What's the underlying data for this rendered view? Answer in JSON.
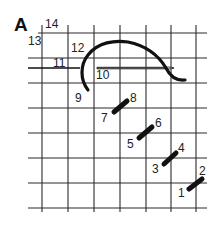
{
  "figure": {
    "panel_label": "A",
    "grid": {
      "vertical_x": [
        42,
        68,
        94,
        120,
        146,
        171,
        196
      ],
      "horizontal_y": [
        33,
        58,
        83,
        108,
        133,
        158,
        183,
        208
      ],
      "x_extent": [
        28,
        207
      ],
      "y_extent": [
        25,
        212
      ],
      "line_color": "#2a2a2a"
    },
    "point_labels": [
      {
        "id": "1",
        "text": "1",
        "x": 178,
        "y": 197
      },
      {
        "id": "2",
        "text": "2",
        "x": 199,
        "y": 175
      },
      {
        "id": "3",
        "text": "3",
        "x": 152,
        "y": 173
      },
      {
        "id": "4",
        "text": "4",
        "x": 178,
        "y": 152
      },
      {
        "id": "5",
        "text": "5",
        "x": 127,
        "y": 148
      },
      {
        "id": "6",
        "text": "6",
        "x": 155,
        "y": 127
      },
      {
        "id": "7",
        "text": "7",
        "x": 101,
        "y": 122
      },
      {
        "id": "8",
        "text": "8",
        "x": 130,
        "y": 102
      },
      {
        "id": "9",
        "text": "9",
        "x": 75,
        "y": 102
      },
      {
        "id": "10",
        "text": "10",
        "x": 96,
        "y": 79
      },
      {
        "id": "11",
        "text": "11",
        "x": 53,
        "y": 67
      },
      {
        "id": "12",
        "text": "12",
        "x": 71,
        "y": 52
      },
      {
        "id": "13",
        "text": "13",
        "x": 28,
        "y": 45
      },
      {
        "id": "14",
        "text": "14",
        "x": 45,
        "y": 28
      }
    ],
    "stitches": [
      {
        "from": "1",
        "to": "2",
        "x1": 189,
        "y1": 189,
        "x2": 202,
        "y2": 179
      },
      {
        "from": "3",
        "to": "4",
        "x1": 164,
        "y1": 164,
        "x2": 176,
        "y2": 153
      },
      {
        "from": "5",
        "to": "6",
        "x1": 139,
        "y1": 138,
        "x2": 152,
        "y2": 127
      },
      {
        "from": "7",
        "to": "8",
        "x1": 114,
        "y1": 112,
        "x2": 127,
        "y2": 101
      }
    ],
    "needle": {
      "x1": 97,
      "x2": 172,
      "y": 68
    },
    "colors": {
      "ink": "#111111",
      "background": "#ffffff"
    }
  }
}
